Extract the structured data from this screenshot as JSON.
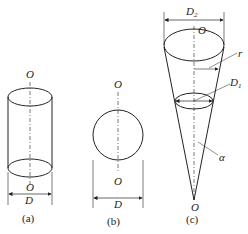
{
  "figures": [
    {
      "id": "a",
      "shape": "cylinder",
      "caption": "(a)",
      "labels": {
        "top_axis": "O",
        "bottom_axis": "O",
        "diameter": "D"
      }
    },
    {
      "id": "b",
      "shape": "sphere",
      "caption": "(b)",
      "labels": {
        "top_axis": "O",
        "bottom_axis": "O",
        "diameter": "D"
      }
    },
    {
      "id": "c",
      "shape": "cone",
      "caption": "(c)",
      "labels": {
        "top_axis": "O",
        "bottom_axis": "O",
        "top_diameter": "D",
        "top_diameter_sub": "2",
        "mid_diameter": "D",
        "mid_diameter_sub": "1",
        "radius": "r",
        "angle": "α"
      }
    }
  ],
  "colors": {
    "stroke": "#222222",
    "background": "#ffffff"
  }
}
